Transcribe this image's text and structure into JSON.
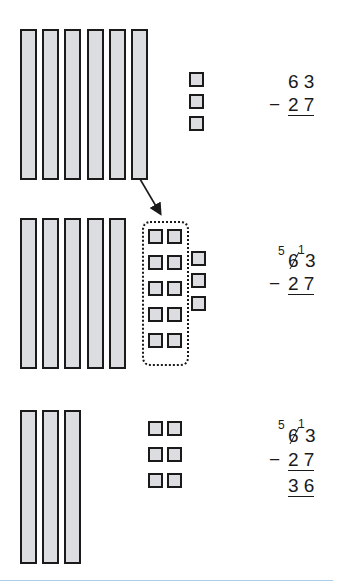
{
  "diagram": {
    "title": "",
    "colors": {
      "block_fill": "#dcdde0",
      "block_stroke": "#1a1a1a",
      "divider": "#a9cde6"
    },
    "step1": {
      "tens_rods": 6,
      "ones_units": 3,
      "problem": {
        "top": "6 3",
        "operator": "−",
        "bottom": "2 7"
      }
    },
    "step2": {
      "tens_rods": 5,
      "regrouped_units": 10,
      "ones_units": 3,
      "annotation": "regroup one ten into ten ones",
      "problem": {
        "borrow_tens": "5",
        "crossed_tens": "6",
        "borrow_ones": "1",
        "ones": "3",
        "operator": "−",
        "bottom": "2 7"
      }
    },
    "step3": {
      "tens_rods": 3,
      "ones_units": 6,
      "problem": {
        "borrow_tens": "5",
        "crossed_tens": "6",
        "borrow_ones": "1",
        "ones": "3",
        "operator": "−",
        "bottom": "2 7",
        "result": "3 6"
      }
    }
  }
}
